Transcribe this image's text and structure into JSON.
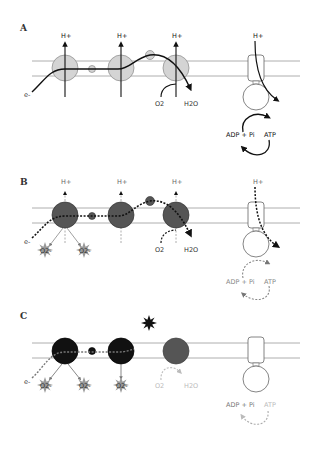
{
  "figure": {
    "panels": [
      {
        "id": "A",
        "label": "A",
        "state": "normal",
        "proton_labels": [
          "H+",
          "H+",
          "H+",
          "H+"
        ],
        "electron_label": "e-",
        "substrate_label": "O2",
        "product_label": "H2O",
        "synthase_substrate": "ADP + Pi",
        "synthase_product": "ATP",
        "complex_fill": "#d4d4d4"
      },
      {
        "id": "B",
        "label": "B",
        "state": "partially-impaired",
        "proton_labels": [
          "H+",
          "H+",
          "H+",
          "H+"
        ],
        "electron_label": "e-",
        "substrate_label": "O2",
        "product_label": "H2O",
        "synthase_substrate": "ADP + Pi",
        "synthase_product": "ATP",
        "ros_labels": [
          "O2-",
          "O2-"
        ],
        "complex_fill": "#555555"
      },
      {
        "id": "C",
        "label": "C",
        "state": "blocked",
        "electron_label": "e-",
        "substrate_label": "O2",
        "product_label": "H2O",
        "synthase_substrate": "ADP + Pi",
        "synthase_product": "ATP",
        "ros_labels": [
          "O2-",
          "O2-",
          "O2-"
        ],
        "complex_fill": "#111111"
      }
    ]
  }
}
